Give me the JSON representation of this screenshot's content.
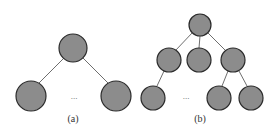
{
  "figure": {
    "panel_a": {
      "label": "(a)",
      "ellipsis": "...",
      "description": "Root node with two leaf children separated by ellipsis"
    },
    "panel_b": {
      "label": "(b)",
      "ellipsis": "...",
      "description": "Root node with three children; first child has one leaf, third child has two leaves; ellipsis between"
    }
  },
  "colors": {
    "node_fill": "#8c8c8c",
    "node_stroke": "#2b2b2b",
    "edge": "#6e6e6e"
  }
}
